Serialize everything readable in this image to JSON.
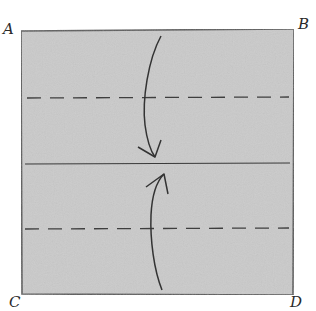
{
  "diagram": {
    "type": "paper-folding-instruction",
    "corners": [
      {
        "id": "A",
        "label": "A",
        "position": "top-left"
      },
      {
        "id": "B",
        "label": "B",
        "position": "top-right"
      },
      {
        "id": "C",
        "label": "C",
        "position": "bottom-left"
      },
      {
        "id": "D",
        "label": "D",
        "position": "bottom-right"
      }
    ],
    "lines": [
      {
        "name": "upper-fold-line",
        "style": "dashed",
        "meaning": "valley fold"
      },
      {
        "name": "center-crease",
        "style": "solid",
        "meaning": "center line"
      },
      {
        "name": "lower-fold-line",
        "style": "dashed",
        "meaning": "valley fold"
      }
    ],
    "arrows": [
      {
        "name": "fold-top-down-arrow",
        "direction": "down",
        "description": "fold top edge down to center"
      },
      {
        "name": "fold-bottom-up-arrow",
        "direction": "up",
        "description": "fold bottom edge up to center"
      }
    ],
    "colors": {
      "paper": "#c9c9c9",
      "paper_edge": "#555555",
      "ink": "#3a3a3a",
      "background": "#ffffff"
    }
  }
}
